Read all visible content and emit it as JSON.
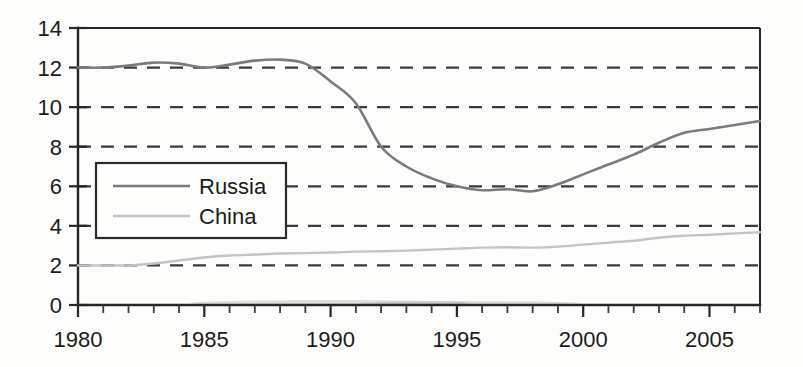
{
  "chart_data": {
    "type": "line",
    "title": "",
    "subtitle": "",
    "xlabel": "",
    "ylabel": "",
    "xlim": [
      1980,
      2007
    ],
    "ylim": [
      0,
      14
    ],
    "grid": true,
    "grid_style": "dashed horizontal",
    "legend_position": "inner upper-left",
    "x": [
      1980,
      1981,
      1982,
      1983,
      1984,
      1985,
      1986,
      1987,
      1988,
      1989,
      1990,
      1991,
      1992,
      1993,
      1994,
      1995,
      1996,
      1997,
      1998,
      1999,
      2000,
      2001,
      2002,
      2003,
      2004,
      2005,
      2006,
      2007
    ],
    "xticks": [
      1980,
      1985,
      1990,
      1995,
      2000,
      2005
    ],
    "xtick_labels": [
      "1980",
      "1985",
      "1990",
      "1995",
      "2000",
      "2005"
    ],
    "xticks_minor_step": 1,
    "yticks": [
      0,
      2,
      4,
      6,
      8,
      10,
      12,
      14
    ],
    "ytick_labels": [
      "0",
      "2",
      "4",
      "6",
      "8",
      "10",
      "12",
      "14"
    ],
    "series": [
      {
        "name": "Russia",
        "color": "#7b7b7b",
        "values": [
          12.0,
          12.0,
          12.1,
          12.25,
          12.2,
          12.0,
          12.15,
          12.35,
          12.4,
          12.2,
          11.3,
          10.2,
          8.0,
          7.0,
          6.4,
          6.0,
          5.8,
          5.85,
          5.75,
          6.1,
          6.6,
          7.1,
          7.6,
          8.2,
          8.7,
          8.9,
          9.1,
          9.3
        ]
      },
      {
        "name": "China",
        "color": "#c4c4c4",
        "values": [
          2.0,
          2.0,
          2.0,
          2.1,
          2.25,
          2.4,
          2.5,
          2.55,
          2.6,
          2.62,
          2.65,
          2.7,
          2.72,
          2.75,
          2.8,
          2.85,
          2.9,
          2.92,
          2.9,
          2.95,
          3.05,
          3.15,
          3.25,
          3.4,
          3.5,
          3.55,
          3.62,
          3.68
        ]
      }
    ]
  },
  "legend": {
    "items": [
      {
        "label": "Russia",
        "color": "#7b7b7b"
      },
      {
        "label": "China",
        "color": "#c4c4c4"
      }
    ]
  },
  "axes": {
    "y_tick_labels": [
      "14",
      "12",
      "10",
      "8",
      "6",
      "4",
      "2",
      "0"
    ],
    "x_tick_labels": [
      "1980",
      "1985",
      "1990",
      "1995",
      "2000",
      "2005"
    ]
  },
  "colors": {
    "background": "#fdfdfb",
    "axis": "#262626",
    "gridline": "#3a3a3a",
    "russia": "#7b7b7b",
    "china": "#c4c4c4"
  }
}
